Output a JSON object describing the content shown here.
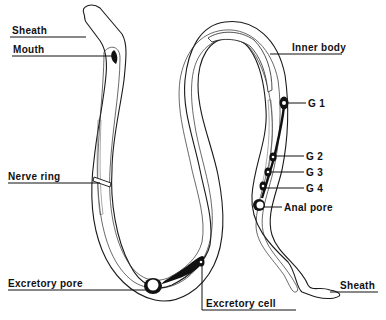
{
  "figure": {
    "colors": {
      "ink": "#111111",
      "background": "#ffffff"
    }
  },
  "labels": {
    "sheath_head": "Sheath",
    "mouth": "Mouth",
    "nerve_ring": "Nerve ring",
    "excretory_pore": "Excretory pore",
    "excretory_cell": "Excretory cell",
    "inner_body": "Inner body",
    "g1": "G 1",
    "g2": "G 2",
    "g3": "G 3",
    "g4": "G 4",
    "anal_pore": "Anal pore",
    "sheath_tail": "Sheath"
  }
}
